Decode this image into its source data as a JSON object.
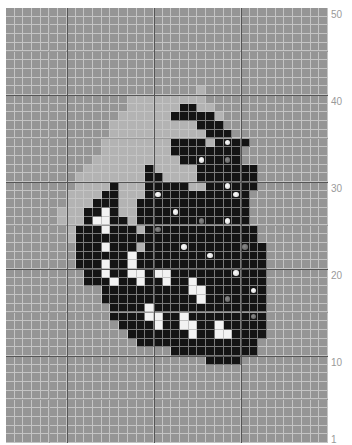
{
  "grid": {
    "columns": 37,
    "rows_count": 50,
    "legend": {
      ".": "background gray",
      "l": "light gray",
      "k": "black",
      "w": "white",
      "o": "white dot on black",
      "g": "gray dot on black"
    },
    "colors": {
      "background": "#959595",
      "light": "#b3b3b3",
      "black": "#141414",
      "white": "#f2f2f2",
      "gridline": "#c4c4c4",
      "major_gridline": "#555555"
    },
    "rows_top_to_bottom": [
      ".....................................",
      ".....................................",
      ".....................................",
      ".....................................",
      ".....................................",
      ".....................................",
      ".....................................",
      ".....................................",
      ".....................................",
      "......................l..............",
      "..............lllllllll..............",
      "..............llllllkkll.............",
      ".............llllllkkkkkl............",
      "............llllllllllkkk............",
      "............lllllllllllkkk...........",
      "...........llllllllkkkklkokk..........",
      "...........llllllllkkkkkkkk..........",
      "..........llllllllllkkokkgk..........",
      ".........lllllllklllllkkkkkkk.........",
      "........llllllllkkllllkkkkkkk.........",
      "........llllklllkkkkkl kkokkk.........",
      ".......llllkklllkokkkkkkkkok.........",
      ".......lllkkkllkkkkkkkkkkkkk.........",
      "......lllkkwkllkkkkokkkkkkkk.........",
      "......lllkwwkklkkkkkkkgkkokk.........",
      ".......lkkkwkkklkgkkkkkkkkkkk........",
      ".......lkkkkkkkkkkkkkkkkkkkkk........",
      "........kkkwkkklkkkkokkkkkkgkk.......",
      "........kkkkkkwkkkkkkkkokkkkkk.......",
      "........kkkwkkwkkkkkkkkkkkkkkk.......",
      ".........kkwkkwwkwwkkkkkkkokkk.......",
      ".........kkkwkkwkkwkkwkkkkkkkk.......",
      "...........kkkkkkkkkkwwkkkkkok.......",
      "...........kkkkkkkkkkkwkkgkkkk.......",
      "............kkkkwkkkkkkkkkkkkk.......",
      "............kkkkwwkkwkkkkkkkgk.......",
      ".............kkkkwkkwwkkwkkkkk.......",
      "..............kkkkkkkwkkwwkkkk.......",
      "...............kkkkkkkkkkkkkk........",
      "...................kkkkkkkkkk........",
      ".......................kkkk..........",
      ".....................................",
      ".....................................",
      ".....................................",
      ".....................................",
      ".....................................",
      ".....................................",
      ".....................................",
      ".....................................",
      "....................................."
    ]
  },
  "axis": {
    "y_labels": [
      {
        "text": "50",
        "row": 50
      },
      {
        "text": "40",
        "row": 40
      },
      {
        "text": "30",
        "row": 30
      },
      {
        "text": "20",
        "row": 20
      },
      {
        "text": "10",
        "row": 10
      },
      {
        "text": "1",
        "row": 1
      }
    ]
  }
}
